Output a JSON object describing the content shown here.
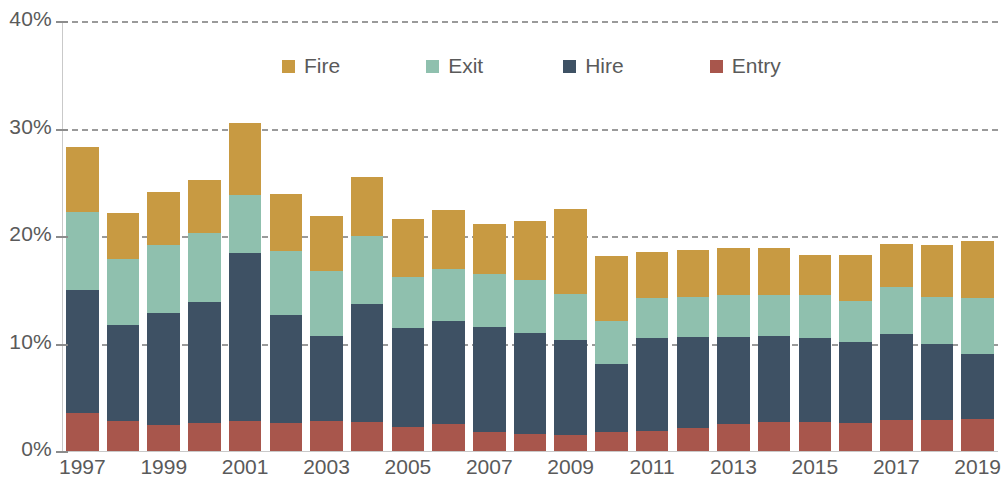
{
  "chart_data": {
    "type": "bar",
    "subtype": "stacked-bar",
    "title": "",
    "subtitle": "",
    "xlabel": "",
    "ylabel": "",
    "ylim": [
      0,
      40
    ],
    "y_unit": "%",
    "y_ticks": [
      "0%",
      "10%",
      "20%",
      "30%",
      "40%"
    ],
    "y_tick_values": [
      0,
      10,
      20,
      30,
      40
    ],
    "grid": "horizontal-dashed",
    "legend_position": "top-center",
    "categories": [
      "1997",
      "1998",
      "1999",
      "2000",
      "2001",
      "2002",
      "2003",
      "2004",
      "2005",
      "2006",
      "2007",
      "2008",
      "2009",
      "2010",
      "2011",
      "2012",
      "2013",
      "2014",
      "2015",
      "2016",
      "2017",
      "2018",
      "2019"
    ],
    "x_tick_labels": [
      "1997",
      "1999",
      "2001",
      "2003",
      "2005",
      "2007",
      "2009",
      "2011",
      "2013",
      "2015",
      "2017",
      "2019"
    ],
    "stack_order_bottom_to_top": [
      "Entry",
      "Hire",
      "Exit",
      "Fire"
    ],
    "series": [
      {
        "name": "Entry",
        "color": "#A8564C",
        "values": [
          3.5,
          2.8,
          2.4,
          2.6,
          2.8,
          2.6,
          2.8,
          2.7,
          2.2,
          2.5,
          1.8,
          1.6,
          1.5,
          1.8,
          1.9,
          2.1,
          2.5,
          2.7,
          2.7,
          2.6,
          2.9,
          2.9,
          3.0
        ]
      },
      {
        "name": "Hire",
        "color": "#3E5164",
        "values": [
          11.5,
          8.9,
          10.4,
          11.3,
          15.6,
          10.1,
          7.9,
          11.0,
          9.2,
          9.6,
          9.7,
          9.4,
          8.8,
          6.3,
          8.6,
          8.5,
          8.1,
          8.0,
          7.8,
          7.5,
          8.0,
          7.1,
          6.0
        ]
      },
      {
        "name": "Exit",
        "color": "#8FC0AE",
        "values": [
          7.2,
          6.2,
          6.4,
          6.4,
          5.4,
          5.9,
          6.0,
          6.3,
          4.8,
          4.8,
          5.0,
          4.9,
          4.3,
          4.0,
          3.7,
          3.7,
          3.9,
          3.8,
          4.0,
          3.9,
          4.4,
          4.3,
          5.2
        ]
      },
      {
        "name": "Fire",
        "color": "#C89A42",
        "values": [
          6.1,
          4.2,
          4.9,
          4.9,
          6.7,
          5.3,
          5.2,
          5.5,
          5.4,
          5.5,
          4.6,
          5.5,
          7.9,
          6.0,
          4.3,
          4.4,
          4.4,
          4.4,
          3.7,
          4.2,
          4.0,
          4.9,
          5.3
        ]
      }
    ],
    "totals": [
      28.3,
      22.1,
      24.1,
      25.2,
      30.5,
      23.9,
      21.9,
      25.5,
      21.6,
      22.4,
      21.1,
      21.4,
      22.5,
      18.1,
      18.5,
      18.7,
      18.9,
      18.9,
      18.2,
      18.2,
      19.3,
      19.2,
      19.5
    ]
  },
  "legend": {
    "items": [
      {
        "label": "Fire",
        "swatch_name": "legend-swatch-fire",
        "color": "#C89A42"
      },
      {
        "label": "Exit",
        "swatch_name": "legend-swatch-exit",
        "color": "#8FC0AE"
      },
      {
        "label": "Hire",
        "swatch_name": "legend-swatch-hire",
        "color": "#3E5164"
      },
      {
        "label": "Entry",
        "swatch_name": "legend-swatch-entry",
        "color": "#A8564C"
      }
    ]
  },
  "axis": {
    "y_labels": [
      "40%",
      "30%",
      "20%",
      "10%",
      "0%"
    ],
    "x_labels": [
      "1997",
      "1999",
      "2001",
      "2003",
      "2005",
      "2007",
      "2009",
      "2011",
      "2013",
      "2015",
      "2017",
      "2019"
    ]
  },
  "colors": {
    "fire": "#C89A42",
    "exit": "#8FC0AE",
    "hire": "#3E5164",
    "entry": "#A8564C",
    "gridline": "#9a9a9a",
    "axis": "#c9c9c9",
    "text": "#5a5a5a",
    "background": "#ffffff"
  }
}
